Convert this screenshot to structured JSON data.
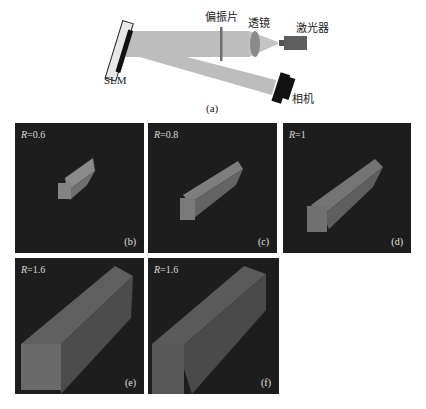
{
  "setup": {
    "labels": {
      "slm": "SLM",
      "polarizer": "偏振片",
      "lens": "透镜",
      "laser": "激光器",
      "camera": "相机"
    },
    "caption": "(a)"
  },
  "panels": [
    {
      "id": "b",
      "r_symbol": "R",
      "r_value": "=0.6",
      "label": "(b)"
    },
    {
      "id": "c",
      "r_symbol": "R",
      "r_value": "=0.8",
      "label": "(c)"
    },
    {
      "id": "d",
      "r_symbol": "R",
      "r_value": "=1",
      "label": "(d)"
    },
    {
      "id": "e",
      "r_symbol": "R",
      "r_value": "=1.6",
      "label": "(e)"
    },
    {
      "id": "f",
      "r_symbol": "R",
      "r_value": "=1.6",
      "label": "(f)"
    }
  ],
  "colors": {
    "beam": "#b8b8b8",
    "polarizer": "#6e6e6e",
    "lens": "#8a8a8a",
    "laser": "#5e5e5e",
    "device": "#111111",
    "panel_bg": "#1d1d1d",
    "bar": "#7a7a7a"
  }
}
